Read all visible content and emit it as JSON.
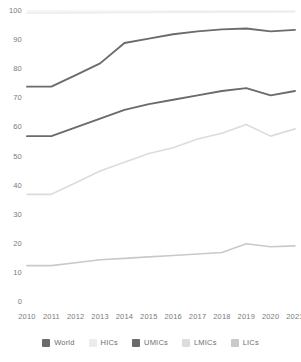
{
  "chart_data": {
    "type": "line",
    "title": "",
    "subtitle": "",
    "xlabel": "",
    "ylabel": "",
    "x": [
      2010,
      2011,
      2012,
      2013,
      2014,
      2015,
      2016,
      2017,
      2018,
      2019,
      2020,
      2021
    ],
    "categories": [
      "2010",
      "2011",
      "2012",
      "2013",
      "2014",
      "2015",
      "2016",
      "2017",
      "2018",
      "2019",
      "2020",
      "2021"
    ],
    "ylim": [
      0,
      100
    ],
    "yticks": [
      0,
      10,
      20,
      30,
      40,
      50,
      60,
      70,
      80,
      90,
      100
    ],
    "ytick_labels": [
      "0",
      "10",
      "20",
      "30",
      "40",
      "50",
      "60",
      "70",
      "80",
      "90",
      "100"
    ],
    "grid": "top-line-only",
    "legend_position": "bottom",
    "series": [
      {
        "name": "World",
        "color": "#6b6b6b",
        "width": 1.9,
        "values": [
          57,
          57,
          60,
          63,
          66,
          68,
          69.5,
          71,
          72.5,
          73.5,
          71,
          72.5
        ]
      },
      {
        "name": "HICs",
        "color": "#ececec",
        "width": 1.6,
        "values": [
          99.3,
          99.3,
          99.4,
          99.4,
          99.5,
          99.5,
          99.6,
          99.6,
          99.7,
          99.7,
          99.7,
          99.8
        ]
      },
      {
        "name": "UMICs",
        "color": "#6b6b6b",
        "width": 1.9,
        "values": [
          74,
          74,
          78,
          82,
          89,
          90.5,
          92,
          93,
          93.7,
          94,
          93,
          93.5
        ]
      },
      {
        "name": "LMICs",
        "color": "#dcdcdc",
        "width": 1.6,
        "values": [
          37,
          37,
          41,
          45,
          48,
          51,
          53,
          56,
          58,
          61,
          57,
          59.5
        ]
      },
      {
        "name": "LICs",
        "color": "#c9c9c9",
        "width": 1.6,
        "values": [
          12.5,
          12.5,
          13.5,
          14.5,
          15,
          15.5,
          16,
          16.5,
          17,
          20,
          19,
          19.3
        ]
      }
    ]
  },
  "legend": {
    "items": [
      {
        "label": "World",
        "color": "#6b6b6b"
      },
      {
        "label": "HICs",
        "color": "#ececec"
      },
      {
        "label": "UMICs",
        "color": "#6b6b6b"
      },
      {
        "label": "LMICs",
        "color": "#dcdcdc"
      },
      {
        "label": "LICs",
        "color": "#c9c9c9"
      }
    ]
  },
  "axes": {
    "gridline_color": "#ededed",
    "tick_text_color": "#7a7a7a"
  }
}
